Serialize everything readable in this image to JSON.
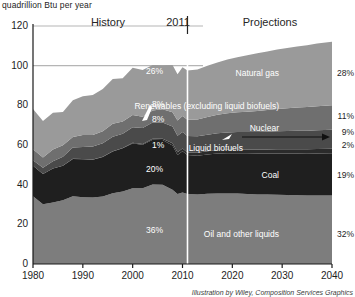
{
  "figure": {
    "axis_title": "quadrillion Btu per year",
    "credit": "Illustration by Wiley, Composition Services Graphics",
    "era_history": "History",
    "era_divider_year": "2011",
    "era_projections": "Projections"
  },
  "colors": {
    "natural_gas": "#9a9a9a",
    "renewables": "#6f6f6f",
    "nuclear": "#4a4a4a",
    "liquid_biofuels": "#2b2b2b",
    "coal": "#1f1f1f",
    "oil": "#7d7d7d",
    "background": "#ffffff",
    "axis": "#1a1a1a",
    "gridline": "#b5b5b5",
    "divider": "#ffffff"
  },
  "chart_data": {
    "type": "area",
    "title": "",
    "xlabel": "",
    "ylabel": "quadrillion Btu per year",
    "xlim": [
      1980,
      2040
    ],
    "ylim": [
      0,
      120
    ],
    "xticks": [
      1980,
      1990,
      2000,
      2010,
      2020,
      2030,
      2040
    ],
    "yticks": [
      0,
      20,
      40,
      60,
      80,
      100,
      120
    ],
    "grid": false,
    "gridlines_shown_at": [
      100,
      120
    ],
    "divider_x": 2011,
    "legend": "inline-right",
    "x": [
      1980,
      1982,
      1984,
      1986,
      1988,
      1990,
      1992,
      1994,
      1996,
      1998,
      2000,
      2002,
      2004,
      2006,
      2008,
      2009,
      2010,
      2011,
      2013,
      2015,
      2017,
      2019,
      2021,
      2023,
      2025,
      2027,
      2029,
      2031,
      2033,
      2035,
      2037,
      2040
    ],
    "series": [
      {
        "name": "Oil and other liquids",
        "label": "Oil and other liquids",
        "pct_2011": "36%",
        "pct_2040": "32%",
        "color": "#7d7d7d",
        "values": [
          34.2,
          30.1,
          31.0,
          32.2,
          34.2,
          33.6,
          33.5,
          34.0,
          35.7,
          36.6,
          38.2,
          38.2,
          40.1,
          40.0,
          37.4,
          35.3,
          36.0,
          35.3,
          35.0,
          35.4,
          35.6,
          35.6,
          35.5,
          35.3,
          35.1,
          35.0,
          34.9,
          34.8,
          34.7,
          34.6,
          34.6,
          34.6
        ]
      },
      {
        "name": "Coal",
        "label": "Coal",
        "pct_2011": "20%",
        "pct_2040": "19%",
        "color": "#1f1f1f",
        "values": [
          15.4,
          15.3,
          17.1,
          17.3,
          18.8,
          19.2,
          19.1,
          19.9,
          21.0,
          21.7,
          22.6,
          21.9,
          22.5,
          22.5,
          22.4,
          19.7,
          20.8,
          19.6,
          19.6,
          19.8,
          20.1,
          20.3,
          20.4,
          20.5,
          20.6,
          20.7,
          20.8,
          20.9,
          21.0,
          21.0,
          21.1,
          21.2
        ]
      },
      {
        "name": "Liquid biofuels",
        "label": "Liquid biofuels",
        "pct_2011": "1%",
        "pct_2040": "2%",
        "color": "#2b2b2b",
        "values": [
          0.0,
          0.0,
          0.1,
          0.1,
          0.1,
          0.1,
          0.1,
          0.2,
          0.2,
          0.2,
          0.3,
          0.4,
          0.5,
          0.7,
          1.1,
          1.3,
          1.4,
          1.3,
          1.5,
          1.6,
          1.7,
          1.8,
          1.9,
          1.9,
          2.0,
          2.0,
          2.1,
          2.1,
          2.2,
          2.2,
          2.3,
          2.3
        ]
      },
      {
        "name": "Nuclear",
        "label": "Nuclear",
        "pct_2011": "8%",
        "pct_2040": "9%",
        "color": "#4a4a4a",
        "values": [
          2.7,
          3.1,
          3.6,
          4.5,
          5.6,
          6.1,
          6.5,
          6.8,
          7.2,
          7.2,
          7.9,
          8.1,
          8.2,
          8.2,
          8.4,
          8.4,
          8.4,
          8.3,
          8.3,
          8.4,
          8.5,
          8.6,
          8.7,
          8.8,
          8.9,
          9.0,
          9.1,
          9.2,
          9.3,
          9.4,
          9.5,
          9.6
        ]
      },
      {
        "name": "Renewables (excluding liquid biofuels)",
        "label": "Renewables (excluding liquid biofuels)",
        "pct_2011": "8%",
        "pct_2040": "11%",
        "color": "#6f6f6f",
        "values": [
          5.5,
          5.2,
          5.9,
          5.8,
          5.3,
          6.0,
          5.9,
          6.0,
          6.6,
          6.1,
          6.1,
          5.7,
          6.1,
          6.6,
          7.2,
          7.6,
          8.0,
          8.2,
          8.5,
          8.9,
          9.3,
          9.7,
          10.0,
          10.3,
          10.6,
          10.9,
          11.2,
          11.5,
          11.7,
          11.9,
          12.1,
          12.3
        ]
      },
      {
        "name": "Natural gas",
        "label": "Natural gas",
        "pct_2011": "26%",
        "pct_2040": "28%",
        "color": "#9a9a9a",
        "values": [
          20.4,
          18.4,
          18.5,
          16.7,
          18.6,
          19.6,
          20.1,
          21.3,
          22.6,
          21.9,
          23.8,
          23.5,
          22.9,
          22.2,
          23.8,
          23.4,
          24.6,
          24.9,
          25.2,
          25.8,
          26.4,
          27.1,
          27.8,
          28.4,
          29.0,
          29.5,
          30.0,
          30.4,
          30.8,
          31.2,
          31.6,
          32.1
        ]
      }
    ],
    "totals_note": "Stacked total rises from about 78 in 1980 to about 108 in 2040"
  }
}
